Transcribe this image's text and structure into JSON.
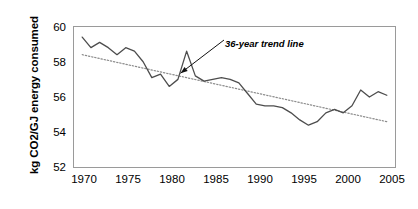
{
  "chart_data": {
    "type": "line",
    "title": "",
    "xlabel": "",
    "ylabel": "kg CO2/GJ energy consumed",
    "xlim": [
      1969,
      2006
    ],
    "ylim": [
      52,
      60
    ],
    "grid": false,
    "legend": "none",
    "x_ticks": [
      "1970",
      "1975",
      "1980",
      "1985",
      "1990",
      "1995",
      "2000",
      "2005"
    ],
    "y_ticks": [
      "52",
      "54",
      "56",
      "58",
      "60"
    ],
    "annotations": [
      {
        "text": "36-year trend line",
        "points_to_x": 1981.3,
        "points_to_y": 57.35
      }
    ],
    "series": [
      {
        "name": "kg CO2/GJ energy consumed",
        "type": "line",
        "style": "solid",
        "color": "#4d4d4d",
        "x": [
          1970,
          1971,
          1972,
          1973,
          1974,
          1975,
          1976,
          1977,
          1978,
          1979,
          1980,
          1981,
          1982,
          1983,
          1984,
          1985,
          1986,
          1987,
          1988,
          1989,
          1990,
          1991,
          1992,
          1993,
          1994,
          1995,
          1996,
          1997,
          1998,
          1999,
          2000,
          2001,
          2002,
          2003,
          2004,
          2005
        ],
        "values": [
          59.4,
          58.8,
          59.1,
          58.8,
          58.4,
          58.8,
          58.6,
          58.0,
          57.1,
          57.3,
          56.6,
          57.0,
          58.6,
          57.2,
          56.9,
          57.0,
          57.1,
          57.0,
          56.8,
          56.2,
          55.6,
          55.5,
          55.5,
          55.4,
          55.1,
          54.7,
          54.4,
          54.6,
          55.1,
          55.3,
          55.1,
          55.5,
          56.4,
          56.0,
          56.3,
          56.1
        ]
      },
      {
        "name": "36-year trend line",
        "type": "line",
        "style": "dotted",
        "color": "#8c8c8c",
        "x": [
          1970,
          2005
        ],
        "values": [
          58.4,
          54.6
        ]
      }
    ]
  }
}
